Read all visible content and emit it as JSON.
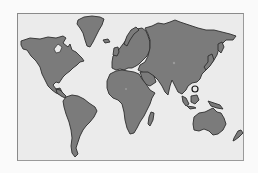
{
  "map": {
    "title": "World Map",
    "style": "grayscale silhouette",
    "colors": {
      "page_background": "#fafafa",
      "ocean": "#ebebeb",
      "land": "#7b7b7b",
      "coastline": "#2e2e2e",
      "frame_border": "#8a8a8a"
    },
    "regions": [
      {
        "id": "north-america",
        "label": "North America"
      },
      {
        "id": "greenland",
        "label": "Greenland"
      },
      {
        "id": "south-america",
        "label": "South America"
      },
      {
        "id": "europe",
        "label": "Europe"
      },
      {
        "id": "asia",
        "label": "Asia"
      },
      {
        "id": "africa",
        "label": "Africa"
      },
      {
        "id": "madagascar",
        "label": "Madagascar"
      },
      {
        "id": "australia",
        "label": "Australia"
      },
      {
        "id": "new-zealand",
        "label": "New Zealand"
      }
    ],
    "markers": [
      {
        "id": "southeast-asia-ring",
        "type": "ring",
        "x": 195,
        "y": 89
      },
      {
        "id": "central-asia-dot",
        "type": "dot",
        "x": 174,
        "y": 63
      },
      {
        "id": "africa-dot",
        "type": "dot",
        "x": 126,
        "y": 89
      }
    ]
  }
}
